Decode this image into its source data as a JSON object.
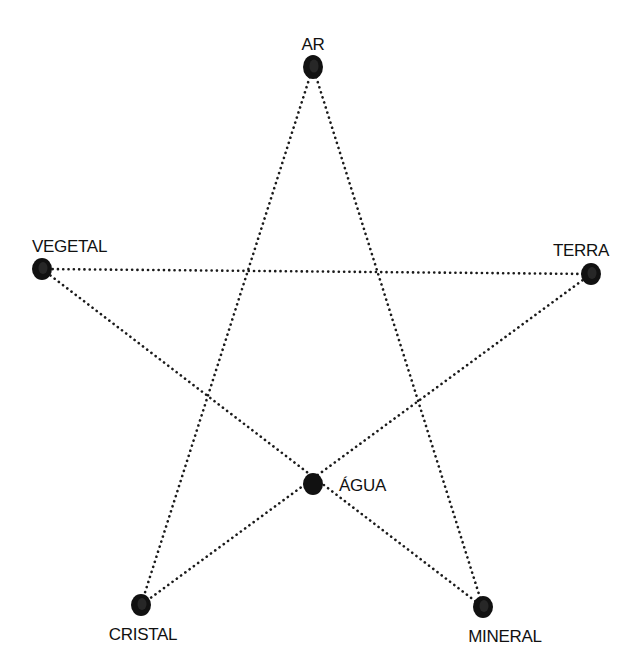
{
  "diagram": {
    "type": "star-network",
    "nodes": [
      {
        "id": "ar",
        "label": "AR",
        "x": 313,
        "y": 67,
        "rx": 10,
        "ry": 12,
        "label_x": 313,
        "label_y": 50,
        "anchor": "middle"
      },
      {
        "id": "vegetal",
        "label": "VEGETAL",
        "x": 42,
        "y": 269,
        "rx": 10,
        "ry": 11,
        "label_x": 32,
        "label_y": 252,
        "anchor": "start"
      },
      {
        "id": "terra",
        "label": "TERRA",
        "x": 591,
        "y": 274,
        "rx": 10,
        "ry": 11,
        "label_x": 609,
        "label_y": 256,
        "anchor": "end"
      },
      {
        "id": "agua",
        "label": "ÁGUA",
        "x": 313,
        "y": 484,
        "rx": 10,
        "ry": 11,
        "label_x": 339,
        "label_y": 491,
        "anchor": "start"
      },
      {
        "id": "cristal",
        "label": "CRISTAL",
        "x": 141,
        "y": 605,
        "rx": 10,
        "ry": 11,
        "label_x": 143,
        "label_y": 640,
        "anchor": "middle"
      },
      {
        "id": "mineral",
        "label": "MINERAL",
        "x": 483,
        "y": 607,
        "rx": 10,
        "ry": 11,
        "label_x": 505,
        "label_y": 642,
        "anchor": "middle"
      }
    ],
    "edges": [
      {
        "from": "ar",
        "to": "cristal"
      },
      {
        "from": "ar",
        "to": "mineral"
      },
      {
        "from": "vegetal",
        "to": "terra"
      },
      {
        "from": "vegetal",
        "to": "mineral"
      },
      {
        "from": "terra",
        "to": "cristal"
      }
    ],
    "colors": {
      "node": "#111111",
      "edge": "#1a1a1a",
      "label": "#111111",
      "background": "#ffffff"
    }
  }
}
